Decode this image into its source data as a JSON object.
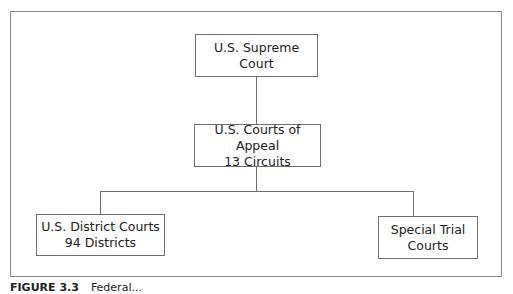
{
  "diagram": {
    "type": "org-chart",
    "nodes": {
      "supreme": {
        "line1": "U.S. Supreme Court"
      },
      "appeals": {
        "line1": "U.S. Courts of Appeal",
        "line2": "13 Circuits"
      },
      "district": {
        "line1": "U.S. District Courts",
        "line2": "94 Districts"
      },
      "special": {
        "line1": "Special Trial",
        "line2": "Courts"
      }
    },
    "edges": [
      [
        "supreme",
        "appeals"
      ],
      [
        "appeals",
        "district"
      ],
      [
        "appeals",
        "special"
      ]
    ]
  },
  "caption": {
    "label": "FIGURE 3.3",
    "text": "Federal..."
  }
}
